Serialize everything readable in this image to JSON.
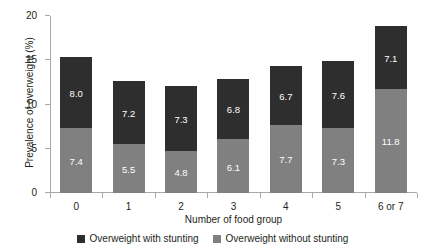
{
  "chart_data": {
    "type": "bar",
    "stacked": true,
    "title": "",
    "xlabel": "Number of food group",
    "ylabel": "Prevalence of overweight (%)",
    "categories": [
      "0",
      "1",
      "2",
      "3",
      "4",
      "5",
      "6 or 7"
    ],
    "ylim": [
      0,
      20
    ],
    "yticks": [
      "0",
      "5",
      "10",
      "15",
      "20"
    ],
    "grid": false,
    "legend_position": "bottom",
    "series": [
      {
        "name": "Overweight without stunting",
        "color": "#808080",
        "values": [
          7.4,
          5.5,
          4.8,
          6.1,
          7.7,
          7.3,
          11.8
        ],
        "labels": [
          "7.4",
          "5.5",
          "4.8",
          "6.1",
          "7.7",
          "7.3",
          "11.8"
        ]
      },
      {
        "name": "Overweight with stunting",
        "color": "#2e2e2e",
        "values": [
          8.0,
          7.2,
          7.3,
          6.8,
          6.7,
          7.6,
          7.1
        ],
        "labels": [
          "8.0",
          "7.2",
          "7.3",
          "6.8",
          "6.7",
          "7.6",
          "7.1"
        ]
      }
    ],
    "totals": [
      15.4,
      12.7,
      12.1,
      12.9,
      14.4,
      14.9,
      18.9
    ]
  },
  "legend": {
    "items": [
      {
        "label": "Overweight with stunting",
        "color": "#2e2e2e"
      },
      {
        "label": "Overweight without stunting",
        "color": "#808080"
      }
    ]
  }
}
